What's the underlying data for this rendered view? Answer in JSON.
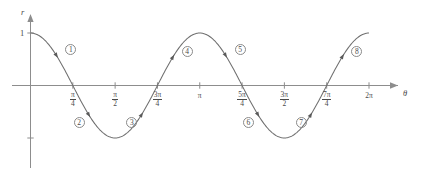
{
  "figure": {
    "name": "polar-cosine-two-theta-graph",
    "y_axis_label": "r",
    "x_axis_label": "θ",
    "y_value_label": "1",
    "colors": {
      "axis": "#8d8d8d",
      "curve": "#6f6f6f",
      "text": "#4a4a4a",
      "background": "#ffffff"
    }
  },
  "x_ticks": [
    {
      "id": "tick-pi-over-4",
      "numerator": "π",
      "denominator": "4",
      "is_fraction": true,
      "label": "π/4",
      "value": 0.7853981634
    },
    {
      "id": "tick-pi-over-2",
      "numerator": "π",
      "denominator": "2",
      "is_fraction": true,
      "label": "π/2",
      "value": 1.5707963268
    },
    {
      "id": "tick-3pi-over-4",
      "numerator": "3π",
      "denominator": "4",
      "is_fraction": true,
      "label": "3π/4",
      "value": 2.3561944902
    },
    {
      "id": "tick-pi",
      "numerator": "π",
      "denominator": "",
      "is_fraction": false,
      "label": "π",
      "value": 3.1415926536
    },
    {
      "id": "tick-5pi-over-4",
      "numerator": "5π",
      "denominator": "4",
      "is_fraction": true,
      "label": "5π/4",
      "value": 3.926990817
    },
    {
      "id": "tick-3pi-over-2",
      "numerator": "3π",
      "denominator": "2",
      "is_fraction": true,
      "label": "3π/2",
      "value": 4.7123889804
    },
    {
      "id": "tick-7pi-over-4",
      "numerator": "7π",
      "denominator": "4",
      "is_fraction": true,
      "label": "7π/4",
      "value": 5.4977871438
    },
    {
      "id": "tick-2pi",
      "numerator": "2π",
      "denominator": "",
      "is_fraction": false,
      "label": "2π",
      "value": 6.2831853072
    }
  ],
  "segment_labels": [
    {
      "id": "segment-1",
      "label": "①",
      "text": "1",
      "theta": 0.48,
      "above_axis": true
    },
    {
      "id": "segment-2",
      "label": "②",
      "text": "2",
      "theta": 1.08,
      "above_axis": false
    },
    {
      "id": "segment-3",
      "label": "③",
      "text": "3",
      "theta": 2.06,
      "above_axis": false
    },
    {
      "id": "segment-4",
      "label": "④",
      "text": "4",
      "theta": 2.64,
      "above_axis": true
    },
    {
      "id": "segment-5",
      "label": "⑤",
      "text": "5",
      "theta": 3.62,
      "above_axis": true
    },
    {
      "id": "segment-6",
      "label": "⑥",
      "text": "6",
      "theta": 4.22,
      "above_axis": false
    },
    {
      "id": "segment-7",
      "label": "⑦",
      "text": "7",
      "theta": 5.2,
      "above_axis": false
    },
    {
      "id": "segment-8",
      "label": "⑧",
      "text": "8",
      "theta": 5.79,
      "above_axis": true
    }
  ],
  "chart_data": {
    "type": "line",
    "title": "",
    "xlabel": "θ",
    "ylabel": "r",
    "function": "r = cos(2θ)",
    "xlim": [
      0,
      6.2831853072
    ],
    "ylim": [
      -1,
      1
    ],
    "grid": false,
    "legend": null,
    "x_tick_values": [
      0.7853981634,
      1.5707963268,
      2.3561944902,
      3.1415926536,
      3.926990817,
      4.7123889804,
      5.4977871438,
      6.2831853072
    ],
    "x_tick_labels": [
      "π/4",
      "π/2",
      "3π/4",
      "π",
      "5π/4",
      "3π/2",
      "7π/4",
      "2π"
    ],
    "y_tick_values": [
      1,
      -1
    ],
    "y_tick_labels": [
      "1",
      ""
    ],
    "series": [
      {
        "name": "r = cos(2θ)",
        "x": [
          0,
          0.1963,
          0.3927,
          0.589,
          0.7854,
          0.9817,
          1.1781,
          1.3744,
          1.5708,
          1.7671,
          1.9635,
          2.1598,
          2.3562,
          2.5525,
          2.7489,
          2.9452,
          3.1416,
          3.3379,
          3.5343,
          3.7306,
          3.927,
          4.1233,
          4.3197,
          4.516,
          4.7124,
          4.9087,
          5.1051,
          5.3014,
          5.4978,
          5.6941,
          5.8905,
          6.0868,
          6.2832
        ],
        "y": [
          1,
          0.9239,
          0.7071,
          0.3827,
          0,
          -0.3827,
          -0.7071,
          -0.9239,
          -1,
          -0.9239,
          -0.7071,
          -0.3827,
          0,
          0.3827,
          0.7071,
          0.9239,
          1,
          0.9239,
          0.7071,
          0.3827,
          0,
          -0.3827,
          -0.7071,
          -0.9239,
          -1,
          -0.9239,
          -0.7071,
          -0.3827,
          0,
          0.3827,
          0.7071,
          0.9239,
          1
        ]
      }
    ],
    "annotations": [
      {
        "label": "①",
        "theta": 0.48,
        "note": "descending branch from r=1 to r=0"
      },
      {
        "label": "②",
        "theta": 1.08,
        "note": "descending branch from r=0 to r=-1"
      },
      {
        "label": "③",
        "theta": 2.06,
        "note": "ascending branch from r=-1 to r=0"
      },
      {
        "label": "④",
        "theta": 2.64,
        "note": "ascending branch from r=0 to r=1"
      },
      {
        "label": "⑤",
        "theta": 3.62,
        "note": "descending branch from r=1 to r=0"
      },
      {
        "label": "⑥",
        "theta": 4.22,
        "note": "descending branch from r=0 to r=-1"
      },
      {
        "label": "⑦",
        "theta": 5.2,
        "note": "ascending branch from r=-1 to r=0"
      },
      {
        "label": "⑧",
        "theta": 5.79,
        "note": "ascending branch from r=0 to r=1"
      }
    ]
  }
}
